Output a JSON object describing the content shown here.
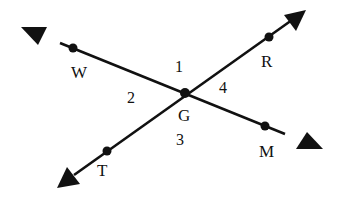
{
  "diagram": {
    "type": "intersecting-lines",
    "intersection": {
      "name": "G",
      "x": 185,
      "y": 93
    },
    "lines": [
      {
        "name": "line-WM",
        "through": [
          "W",
          "G",
          "M"
        ],
        "arrow_start": {
          "x": 21,
          "y": 27
        },
        "arrow_end": {
          "x": 323,
          "y": 149
        }
      },
      {
        "name": "line-TR",
        "through": [
          "T",
          "G",
          "R"
        ],
        "arrow_start": {
          "x": 57,
          "y": 188
        },
        "arrow_end": {
          "x": 306,
          "y": 10
        }
      }
    ],
    "points": {
      "W": {
        "label": "W",
        "x": 73,
        "y": 48
      },
      "R": {
        "label": "R",
        "x": 269,
        "y": 37
      },
      "T": {
        "label": "T",
        "x": 107,
        "y": 151
      },
      "M": {
        "label": "M",
        "x": 265,
        "y": 126
      },
      "G": {
        "label": "G",
        "x": 185,
        "y": 93
      }
    },
    "angles": [
      {
        "label": "1"
      },
      {
        "label": "2"
      },
      {
        "label": "3"
      },
      {
        "label": "4"
      }
    ],
    "colors": {
      "line": "#111111",
      "background": "#ffffff"
    }
  }
}
